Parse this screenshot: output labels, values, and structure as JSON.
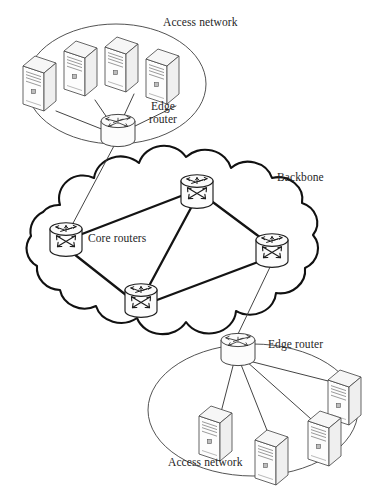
{
  "figure": {
    "background": "#ffffff",
    "ink": "#1a1a1a"
  },
  "labels": {
    "access_network_top": "Access network",
    "edge_router_top": "Edge router",
    "backbone": "Backbone",
    "core_routers": "Core routers",
    "edge_router_bottom": "Edge router",
    "access_network_bottom": "Access network"
  },
  "regions": [
    {
      "id": "access-network-top",
      "kind": "ellipse",
      "label": "Access network",
      "cx": 116,
      "cy": 84,
      "rx": 90,
      "ry": 60,
      "stroke": "#3a3a3a",
      "stroke_width": 0.9
    },
    {
      "id": "backbone-cloud",
      "kind": "cloud",
      "label": "Backbone",
      "cx": 168,
      "cy": 245,
      "rx": 150,
      "ry": 88,
      "stroke": "#111111",
      "stroke_width": 2.1
    },
    {
      "id": "access-network-bottom",
      "kind": "ellipse",
      "label": "Access network",
      "cx": 253,
      "cy": 410,
      "rx": 105,
      "ry": 66,
      "stroke": "#3a3a3a",
      "stroke_width": 0.9
    }
  ],
  "nodes": [
    {
      "id": "pc-top-1",
      "type": "pc",
      "x": 40,
      "y": 75,
      "scale": 1.0
    },
    {
      "id": "pc-top-2",
      "type": "pc",
      "x": 81,
      "y": 60,
      "scale": 1.0
    },
    {
      "id": "pc-top-3",
      "type": "pc",
      "x": 122,
      "y": 56,
      "scale": 1.0
    },
    {
      "id": "pc-top-4",
      "type": "pc",
      "x": 163,
      "y": 68,
      "scale": 1.0
    },
    {
      "id": "edge-router-top",
      "type": "edge-router",
      "x": 118,
      "y": 128,
      "scale": 1.0
    },
    {
      "id": "core-router-left",
      "type": "core-router",
      "x": 66,
      "y": 238,
      "scale": 1.0
    },
    {
      "id": "core-router-top",
      "type": "core-router",
      "x": 197,
      "y": 190,
      "scale": 1.0
    },
    {
      "id": "core-router-right",
      "type": "core-router",
      "x": 272,
      "y": 249,
      "scale": 1.0
    },
    {
      "id": "core-router-bottom",
      "type": "core-router",
      "x": 141,
      "y": 299,
      "scale": 1.0
    },
    {
      "id": "edge-router-bottom",
      "type": "edge-router",
      "x": 238,
      "y": 347,
      "scale": 1.0
    },
    {
      "id": "pc-bot-1",
      "type": "pc",
      "x": 345,
      "y": 389,
      "scale": 1.0
    },
    {
      "id": "pc-bot-2",
      "type": "pc",
      "x": 216,
      "y": 425,
      "scale": 1.0
    },
    {
      "id": "pc-bot-3",
      "type": "pc",
      "x": 272,
      "y": 449,
      "scale": 1.0
    },
    {
      "id": "pc-bot-4",
      "type": "pc",
      "x": 325,
      "y": 430,
      "scale": 1.0
    }
  ],
  "links": [
    {
      "id": "l-top-pc1",
      "from": "pc-top-1",
      "to": "edge-router-top",
      "weight": "thin"
    },
    {
      "id": "l-top-pc2",
      "from": "pc-top-2",
      "to": "edge-router-top",
      "weight": "thin"
    },
    {
      "id": "l-top-pc3",
      "from": "pc-top-3",
      "to": "edge-router-top",
      "weight": "thin"
    },
    {
      "id": "l-top-pc4",
      "from": "pc-top-4",
      "to": "edge-router-top",
      "weight": "thin"
    },
    {
      "id": "l-edge-top-core",
      "from": "edge-router-top",
      "to": "core-router-left",
      "weight": "thin"
    },
    {
      "id": "l-core-left-top",
      "from": "core-router-left",
      "to": "core-router-top",
      "weight": "thick"
    },
    {
      "id": "l-core-top-right",
      "from": "core-router-top",
      "to": "core-router-right",
      "weight": "thick"
    },
    {
      "id": "l-core-top-bottom",
      "from": "core-router-top",
      "to": "core-router-bottom",
      "weight": "thick"
    },
    {
      "id": "l-core-left-bottom",
      "from": "core-router-left",
      "to": "core-router-bottom",
      "weight": "thick"
    },
    {
      "id": "l-core-right-bottom",
      "from": "core-router-right",
      "to": "core-router-bottom",
      "weight": "thick"
    },
    {
      "id": "l-core-right-edge",
      "from": "core-router-right",
      "to": "edge-router-bottom",
      "weight": "thin"
    },
    {
      "id": "l-bot-pc1",
      "from": "edge-router-bottom",
      "to": "pc-bot-1",
      "weight": "thin"
    },
    {
      "id": "l-bot-pc2",
      "from": "edge-router-bottom",
      "to": "pc-bot-2",
      "weight": "thin"
    },
    {
      "id": "l-bot-pc3",
      "from": "edge-router-bottom",
      "to": "pc-bot-3",
      "weight": "thin"
    },
    {
      "id": "l-bot-pc4",
      "from": "edge-router-bottom",
      "to": "pc-bot-4",
      "weight": "thin"
    }
  ],
  "counts": {
    "access_networks": 2,
    "edge_routers": 2,
    "core_routers": 4,
    "hosts_top": 4,
    "hosts_bottom": 4
  }
}
